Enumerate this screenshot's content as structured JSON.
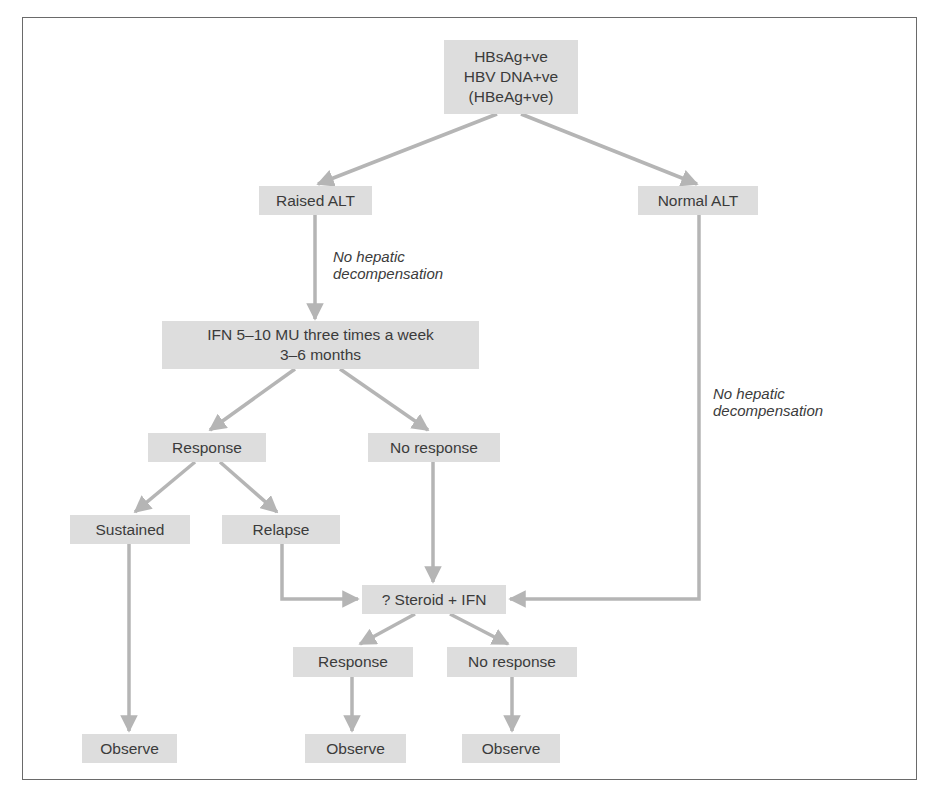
{
  "diagram": {
    "type": "flowchart",
    "colors": {
      "node_fill": "#dddddd",
      "arrow": "#b5b5b5",
      "text": "#3b3b3b",
      "frame": "#6a6a6a"
    },
    "nodes": {
      "start": "HBsAg+ve\nHBV DNA+ve\n(HBeAg+ve)",
      "raised_alt": "Raised ALT",
      "normal_alt": "Normal ALT",
      "ifn": "IFN 5–10 MU three times a week\n3–6 months",
      "response": "Response",
      "no_response": "No response",
      "sustained": "Sustained",
      "relapse": "Relapse",
      "steroid_ifn": "? Steroid + IFN",
      "response2": "Response",
      "no_response2": "No response",
      "observe1": "Observe",
      "observe2": "Observe",
      "observe3": "Observe"
    },
    "edge_labels": {
      "left": "No hepatic\ndecompensation",
      "right": "No hepatic\ndecompensation"
    }
  }
}
